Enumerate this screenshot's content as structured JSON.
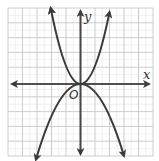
{
  "figure": {
    "x_axis_label": "x",
    "y_axis_label": "y",
    "origin_label": "O",
    "colors": {
      "background": "#ffffff",
      "grid_major": "#c8c8c8",
      "grid_minor": "#e6e6e6",
      "axis": "#444444",
      "curve": "#3a3a3a"
    },
    "grid": {
      "x_range": [
        -5,
        5
      ],
      "y_range": [
        -5,
        5
      ],
      "major_step": 1
    },
    "curves": [
      {
        "name": "upward-parabola",
        "equation": "y = x^2",
        "opens": "up"
      },
      {
        "name": "downward-parabola",
        "equation": "y = -x^2",
        "opens": "down"
      }
    ]
  }
}
